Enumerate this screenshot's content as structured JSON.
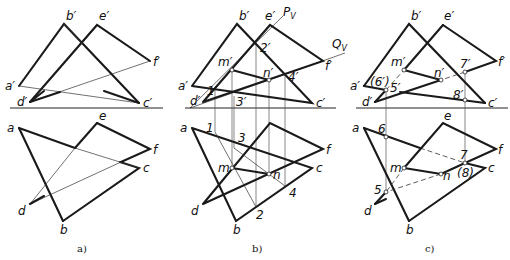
{
  "panels": [
    {
      "caption": "a)",
      "labels": {
        "b_prime": "b′",
        "e_prime": "e′",
        "f_prime": "f′",
        "a_prime": "a′",
        "d_prime": "d′",
        "c_prime": "c′",
        "e": "e",
        "a": "a",
        "f": "f",
        "c": "c",
        "d": "d",
        "b": "b"
      }
    },
    {
      "caption": "b)",
      "labels": {
        "b_prime": "b′",
        "e_prime": "e′",
        "f_prime": "f′",
        "a_prime": "a′",
        "d_prime": "d′",
        "c_prime": "c′",
        "Pv": "P",
        "Pv_sub": "V",
        "Qv": "Q",
        "Qv_sub": "V",
        "m_prime": "m′",
        "n_prime": "n′",
        "p1_prime": "1′",
        "p2_prime": "2′",
        "p3_prime": "3′",
        "p4_prime": "4′",
        "a": "a",
        "f": "f",
        "c": "c",
        "d": "d",
        "b": "b",
        "m": "m",
        "n": "n",
        "p1": "1",
        "p2": "2",
        "p3": "3",
        "p4": "4"
      }
    },
    {
      "caption": "c)",
      "labels": {
        "b_prime": "b′",
        "e_prime": "e′",
        "f_prime": "f′",
        "a_prime": "a′",
        "d_prime": "d′",
        "c_prime": "c′",
        "m_prime": "m′",
        "n_prime": "n′",
        "p5_prime": "5′",
        "p6_prime": "(6′)",
        "p7_prime": "7′",
        "p8_prime": "8′",
        "e": "e",
        "a": "a",
        "f": "f",
        "c": "c",
        "d": "d",
        "b": "b",
        "m": "m",
        "n": "n",
        "p5": "5",
        "p6": "6",
        "p7": "7",
        "p8": "(8)"
      }
    }
  ]
}
